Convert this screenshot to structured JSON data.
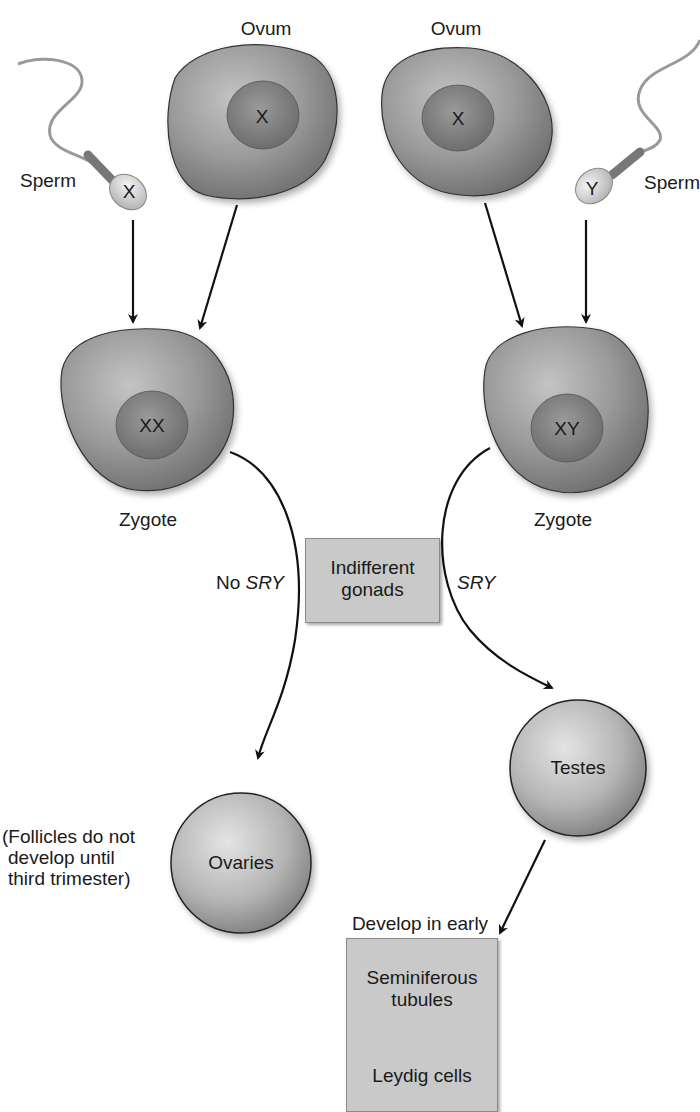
{
  "diagram": {
    "labels": {
      "ovum_left": "Ovum",
      "ovum_right": "Ovum",
      "ovum_left_chromosome": "X",
      "ovum_right_chromosome": "X",
      "sperm_left": "Sperm",
      "sperm_right": "Sperm",
      "sperm_left_chromosome": "X",
      "sperm_right_chromosome": "Y",
      "zygote_left": "Zygote",
      "zygote_right": "Zygote",
      "zygote_left_genotype": "XX",
      "zygote_right_genotype": "XY",
      "no_sry_prefix": "No",
      "sry_gene": "SRY",
      "sry_right": "SRY",
      "indifferent_line1": "Indifferent",
      "indifferent_line2": "gonads",
      "ovaries": "Ovaries",
      "testes": "Testes",
      "follicles_line1": "(Follicles do not",
      "follicles_line2": "develop until",
      "follicles_line3": "third trimester)",
      "develop_line1": "Develop in early",
      "develop_line2": "embryo",
      "seminiferous_line1": "Seminiferous",
      "seminiferous_line2": "tubules",
      "leydig": "Leydig cells"
    },
    "nodes": [
      {
        "id": "sperm-x",
        "label": "Sperm",
        "content": "X"
      },
      {
        "id": "ovum-left",
        "label": "Ovum",
        "content": "X"
      },
      {
        "id": "ovum-right",
        "label": "Ovum",
        "content": "X"
      },
      {
        "id": "sperm-y",
        "label": "Sperm",
        "content": "Y"
      },
      {
        "id": "zygote-xx",
        "label": "Zygote",
        "content": "XX"
      },
      {
        "id": "zygote-xy",
        "label": "Zygote",
        "content": "XY"
      },
      {
        "id": "indifferent-gonads",
        "label": "Indifferent gonads"
      },
      {
        "id": "ovaries",
        "label": "Ovaries"
      },
      {
        "id": "testes",
        "label": "Testes"
      },
      {
        "id": "testis-structures",
        "label": "Seminiferous tubules / Leydig cells"
      }
    ],
    "edges": [
      {
        "from": "sperm-x",
        "to": "zygote-xx"
      },
      {
        "from": "ovum-left",
        "to": "zygote-xx"
      },
      {
        "from": "ovum-right",
        "to": "zygote-xy"
      },
      {
        "from": "sperm-y",
        "to": "zygote-xy"
      },
      {
        "from": "zygote-xx",
        "to": "ovaries",
        "label": "No SRY"
      },
      {
        "from": "zygote-xy",
        "to": "testes",
        "label": "SRY"
      },
      {
        "from": "testes",
        "to": "testis-structures",
        "label": "Develop in early embryo"
      }
    ],
    "colors": {
      "cell_fill": "#8f8f8f",
      "nucleus_fill": "#7a7a7a",
      "box_fill": "#c9c9c9",
      "arrow": "#111111"
    }
  }
}
